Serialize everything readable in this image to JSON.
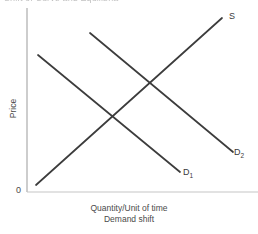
{
  "figure": {
    "title_cutoff": "Shift of Curve and Equilibria",
    "origin_label": "0",
    "y_axis_label": "Price",
    "x_axis_label_line1": "Quantity/Unit of time",
    "x_axis_label_line2": "Demand shift",
    "curve_labels": {
      "supply": "S",
      "demand_initial": "D",
      "demand_initial_sub": "1",
      "demand_shifted": "D",
      "demand_shifted_sub": "2"
    },
    "colors": {
      "curve": "#3c3c3c",
      "axis": "#b4b4b4",
      "text": "#4a4a4a",
      "background": "#ffffff"
    }
  },
  "chart_data": {
    "type": "line",
    "title": "Shift of Curve and Equilibria",
    "xlabel": "Quantity/Unit of time",
    "ylabel": "Price",
    "sublabel": "Demand shift",
    "grid": false,
    "legend": "inline-curve-labels",
    "axis_origin_label": "0",
    "xlim": [
      0,
      258
    ],
    "ylim": [
      0,
      192
    ],
    "note": "Classic supply and demand diagram: an upward-sloping supply curve S crossed by two parallel downward-sloping demand curves, D1 and the rightward-shifted D2. Coordinates are in screenshot pixel space with y measured downward from the top of the image.",
    "series": [
      {
        "name": "S",
        "label": "S",
        "slope_direction": "upward",
        "points": [
          {
            "x": 36,
            "y": 185
          },
          {
            "x": 222,
            "y": 18
          }
        ]
      },
      {
        "name": "D1",
        "label": "D₁",
        "slope_direction": "downward",
        "points": [
          {
            "x": 38,
            "y": 55
          },
          {
            "x": 180,
            "y": 172
          }
        ]
      },
      {
        "name": "D2",
        "label": "D₂",
        "slope_direction": "downward",
        "points": [
          {
            "x": 90,
            "y": 33
          },
          {
            "x": 233,
            "y": 152
          }
        ]
      }
    ],
    "intersections": [
      {
        "name": "equilibrium-1",
        "curves": [
          "S",
          "D1"
        ],
        "x": 108,
        "y": 119
      },
      {
        "name": "equilibrium-2",
        "curves": [
          "S",
          "D2"
        ],
        "x": 146,
        "y": 85
      }
    ],
    "axes": {
      "y_axis": {
        "x": 27,
        "y_top": 8,
        "y_bottom": 192
      },
      "x_axis": {
        "y": 192,
        "x_left": 27,
        "x_right": 258
      }
    }
  }
}
